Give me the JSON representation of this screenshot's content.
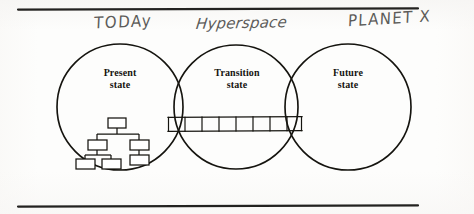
{
  "figure": {
    "kind": "hand-annotated-venn-diagram",
    "background_color": "#fdfdfc",
    "ink_color": "#15140f",
    "pencil_color": "#5d5c5a"
  },
  "rules": {
    "top": {
      "name": "top-rule",
      "x1": 18,
      "x2": 418,
      "y": 9
    },
    "bottom": {
      "name": "bottom-rule",
      "x1": 18,
      "x2": 418,
      "y": 206
    }
  },
  "handwritten_annotations": [
    {
      "id": "today",
      "text": "TODAy",
      "style": "printed-caps"
    },
    {
      "id": "hyperspace",
      "text": "Hyperspace",
      "style": "cursive"
    },
    {
      "id": "planet_x",
      "text": "PLANET X",
      "style": "printed-caps"
    }
  ],
  "circles": [
    {
      "id": "present",
      "label_line1": "Present",
      "label_line2": "state",
      "cx": 120,
      "cy": 107,
      "r": 63,
      "annotation": "today"
    },
    {
      "id": "transition",
      "label_line1": "Transition",
      "label_line2": "state",
      "cx": 236,
      "cy": 107,
      "r": 62,
      "annotation": "hyperspace"
    },
    {
      "id": "future",
      "label_line1": "Future",
      "label_line2": "state",
      "cx": 348,
      "cy": 107,
      "r": 63,
      "annotation": "planet_x"
    }
  ],
  "org_chart": {
    "id": "present-state-org-chart",
    "description": "hierarchy of boxes inside the Present state circle",
    "node_count": 6,
    "levels": 3
  },
  "ladder": {
    "id": "transition-ladder",
    "description": "horizontal ladder / bridge of cells spanning the transition state",
    "x_start": 168,
    "x_end": 302,
    "y_top": 117,
    "y_bottom": 131,
    "cell_count": 8
  }
}
